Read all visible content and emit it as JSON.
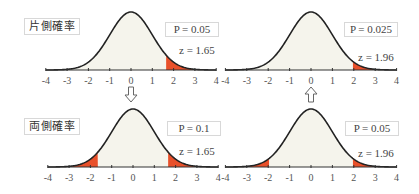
{
  "labels": {
    "one_sided": "片側確率",
    "two_sided": "両側確率"
  },
  "colors": {
    "curve": "#222222",
    "fill": "#f5f4ec",
    "tail": "#e8502a",
    "axis": "#333333",
    "tick_label": "#555555",
    "box_border": "#d8d8d8"
  },
  "arrows": [
    {
      "direction": "down",
      "from": "top-left",
      "to": "bottom-left"
    },
    {
      "direction": "up",
      "from": "bottom-right",
      "to": "top-right"
    }
  ],
  "chart_data": [
    {
      "type": "area",
      "title": "片側確率",
      "position": "top-left",
      "distribution": "standard normal",
      "x_ticks": [
        -4,
        -3,
        -2,
        -1,
        0,
        1,
        2,
        3,
        4
      ],
      "xlim": [
        -4,
        4
      ],
      "shaded_tails": [
        [
          1.65,
          4
        ]
      ],
      "p_label": "P = 0.05",
      "p_value": 0.05,
      "z_label": "z = 1.65",
      "z_value": 1.65
    },
    {
      "type": "area",
      "title": "",
      "position": "top-right",
      "distribution": "standard normal",
      "x_ticks": [
        -4,
        -3,
        -2,
        -1,
        0,
        1,
        2,
        3,
        4
      ],
      "xlim": [
        -4,
        4
      ],
      "shaded_tails": [
        [
          1.96,
          4
        ]
      ],
      "p_label": "P = 0.025",
      "p_value": 0.025,
      "z_label": "z = 1.96",
      "z_value": 1.96
    },
    {
      "type": "area",
      "title": "両側確率",
      "position": "bottom-left",
      "distribution": "standard normal",
      "x_ticks": [
        -4,
        -3,
        -2,
        -1,
        0,
        1,
        2,
        3,
        4
      ],
      "xlim": [
        -4,
        4
      ],
      "shaded_tails": [
        [
          -4,
          -1.65
        ],
        [
          1.65,
          4
        ]
      ],
      "p_label": "P = 0.1",
      "p_value": 0.1,
      "z_label": "z = 1.65",
      "z_value": 1.65
    },
    {
      "type": "area",
      "title": "",
      "position": "bottom-right",
      "distribution": "standard normal",
      "x_ticks": [
        -4,
        -3,
        -2,
        -1,
        0,
        1,
        2,
        3,
        4
      ],
      "xlim": [
        -4,
        4
      ],
      "shaded_tails": [
        [
          -4,
          -1.96
        ],
        [
          1.96,
          4
        ]
      ],
      "p_label": "P = 0.05",
      "p_value": 0.05,
      "z_label": "z = 1.96",
      "z_value": 1.96
    }
  ]
}
